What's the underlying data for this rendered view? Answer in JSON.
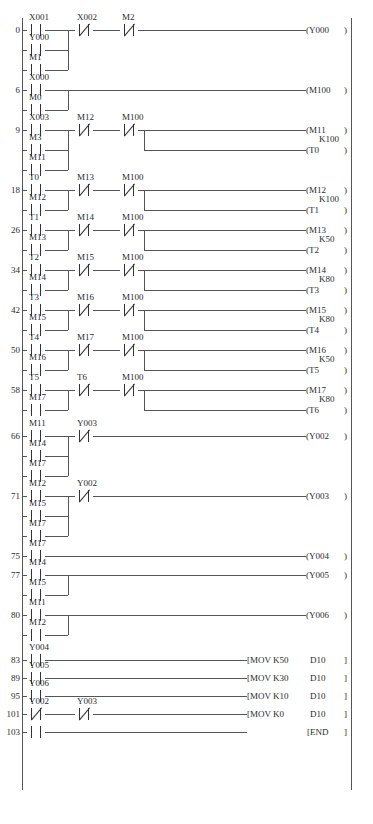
{
  "diagram": {
    "type": "plc-ladder-logic",
    "end_label": "END",
    "mov_label": "MOV",
    "rungs": [
      {
        "step": "0",
        "inputs_series": [
          {
            "name": "X001",
            "type": "NO"
          },
          {
            "name": "X002",
            "type": "NC"
          },
          {
            "name": "M2",
            "type": "NC"
          }
        ],
        "parallel_branch": [
          {
            "name": "Y000",
            "type": "NO"
          },
          {
            "name": "M1",
            "type": "NO"
          }
        ],
        "outputs": [
          {
            "name": "Y000",
            "type": "coil"
          }
        ]
      },
      {
        "step": "6",
        "inputs_series": [
          {
            "name": "X000",
            "type": "NO"
          }
        ],
        "parallel_branch": [
          {
            "name": "M0",
            "type": "NO"
          }
        ],
        "outputs": [
          {
            "name": "M100",
            "type": "coil"
          }
        ]
      },
      {
        "step": "9",
        "inputs_series": [
          {
            "name": "X003",
            "type": "NO"
          },
          {
            "name": "M12",
            "type": "NC"
          },
          {
            "name": "M100",
            "type": "NC"
          }
        ],
        "parallel_branch": [
          {
            "name": "M3",
            "type": "NO"
          },
          {
            "name": "M11",
            "type": "NO"
          }
        ],
        "outputs": [
          {
            "name": "M11",
            "type": "coil"
          },
          {
            "name": "T0",
            "type": "timer",
            "preset": "K100"
          }
        ]
      },
      {
        "step": "18",
        "inputs_series": [
          {
            "name": "T0",
            "type": "NO"
          },
          {
            "name": "M13",
            "type": "NC"
          },
          {
            "name": "M100",
            "type": "NC"
          }
        ],
        "parallel_branch": [
          {
            "name": "M12",
            "type": "NO"
          }
        ],
        "outputs": [
          {
            "name": "M12",
            "type": "coil"
          },
          {
            "name": "T1",
            "type": "timer",
            "preset": "K100"
          }
        ]
      },
      {
        "step": "26",
        "inputs_series": [
          {
            "name": "T1",
            "type": "NO"
          },
          {
            "name": "M14",
            "type": "NC"
          },
          {
            "name": "M100",
            "type": "NC"
          }
        ],
        "parallel_branch": [
          {
            "name": "M13",
            "type": "NO"
          }
        ],
        "outputs": [
          {
            "name": "M13",
            "type": "coil"
          },
          {
            "name": "T2",
            "type": "timer",
            "preset": "K50"
          }
        ]
      },
      {
        "step": "34",
        "inputs_series": [
          {
            "name": "T2",
            "type": "NO"
          },
          {
            "name": "M15",
            "type": "NC"
          },
          {
            "name": "M100",
            "type": "NC"
          }
        ],
        "parallel_branch": [
          {
            "name": "M14",
            "type": "NO"
          }
        ],
        "outputs": [
          {
            "name": "M14",
            "type": "coil"
          },
          {
            "name": "T3",
            "type": "timer",
            "preset": "K80"
          }
        ]
      },
      {
        "step": "42",
        "inputs_series": [
          {
            "name": "T3",
            "type": "NO"
          },
          {
            "name": "M16",
            "type": "NC"
          },
          {
            "name": "M100",
            "type": "NC"
          }
        ],
        "parallel_branch": [
          {
            "name": "M15",
            "type": "NO"
          }
        ],
        "outputs": [
          {
            "name": "M15",
            "type": "coil"
          },
          {
            "name": "T4",
            "type": "timer",
            "preset": "K80"
          }
        ]
      },
      {
        "step": "50",
        "inputs_series": [
          {
            "name": "T4",
            "type": "NO"
          },
          {
            "name": "M17",
            "type": "NC"
          },
          {
            "name": "M100",
            "type": "NC"
          }
        ],
        "parallel_branch": [
          {
            "name": "M16",
            "type": "NO"
          }
        ],
        "outputs": [
          {
            "name": "M16",
            "type": "coil"
          },
          {
            "name": "T5",
            "type": "timer",
            "preset": "K50"
          }
        ]
      },
      {
        "step": "58",
        "inputs_series": [
          {
            "name": "T5",
            "type": "NO"
          },
          {
            "name": "T6",
            "type": "NC"
          },
          {
            "name": "M100",
            "type": "NC"
          }
        ],
        "parallel_branch": [
          {
            "name": "M17",
            "type": "NO"
          }
        ],
        "outputs": [
          {
            "name": "M17",
            "type": "coil"
          },
          {
            "name": "T6",
            "type": "timer",
            "preset": "K80"
          }
        ]
      },
      {
        "step": "66",
        "inputs_series": [
          {
            "name": "M11",
            "type": "NO"
          },
          {
            "name": "Y003",
            "type": "NC"
          }
        ],
        "parallel_branch": [
          {
            "name": "M14",
            "type": "NO"
          },
          {
            "name": "M17",
            "type": "NO"
          }
        ],
        "outputs": [
          {
            "name": "Y002",
            "type": "coil"
          }
        ]
      },
      {
        "step": "71",
        "inputs_series": [
          {
            "name": "M12",
            "type": "NO"
          },
          {
            "name": "Y002",
            "type": "NC"
          }
        ],
        "parallel_branch": [
          {
            "name": "M15",
            "type": "NO"
          },
          {
            "name": "M17",
            "type": "NO"
          }
        ],
        "outputs": [
          {
            "name": "Y003",
            "type": "coil"
          }
        ]
      },
      {
        "step": "75",
        "inputs_series": [
          {
            "name": "M17",
            "type": "NO"
          }
        ],
        "parallel_branch": [],
        "outputs": [
          {
            "name": "Y004",
            "type": "coil"
          }
        ]
      },
      {
        "step": "77",
        "inputs_series": [
          {
            "name": "M14",
            "type": "NO"
          }
        ],
        "parallel_branch": [
          {
            "name": "M15",
            "type": "NO"
          }
        ],
        "outputs": [
          {
            "name": "Y005",
            "type": "coil"
          }
        ]
      },
      {
        "step": "80",
        "inputs_series": [
          {
            "name": "M11",
            "type": "NO"
          }
        ],
        "parallel_branch": [
          {
            "name": "M12",
            "type": "NO"
          }
        ],
        "outputs": [
          {
            "name": "Y006",
            "type": "coil"
          }
        ]
      },
      {
        "step": "83",
        "inputs_series": [
          {
            "name": "Y004",
            "type": "NO"
          }
        ],
        "parallel_branch": [],
        "outputs": [
          {
            "name": "MOV",
            "type": "func",
            "src": "K50",
            "dst": "D10"
          }
        ]
      },
      {
        "step": "89",
        "inputs_series": [
          {
            "name": "Y005",
            "type": "NO"
          }
        ],
        "parallel_branch": [],
        "outputs": [
          {
            "name": "MOV",
            "type": "func",
            "src": "K30",
            "dst": "D10"
          }
        ]
      },
      {
        "step": "95",
        "inputs_series": [
          {
            "name": "Y006",
            "type": "NO"
          }
        ],
        "parallel_branch": [],
        "outputs": [
          {
            "name": "MOV",
            "type": "func",
            "src": "K10",
            "dst": "D10"
          }
        ]
      },
      {
        "step": "101",
        "inputs_series": [
          {
            "name": "Y002",
            "type": "NC"
          },
          {
            "name": "Y003",
            "type": "NC"
          }
        ],
        "parallel_branch": [],
        "outputs": [
          {
            "name": "MOV",
            "type": "func",
            "src": "K0",
            "dst": "D10"
          }
        ]
      },
      {
        "step": "103",
        "inputs_series": [
          {
            "name": "",
            "type": "NO"
          }
        ],
        "parallel_branch": [],
        "outputs": [
          {
            "name": "END",
            "type": "end"
          }
        ]
      }
    ]
  },
  "style": {
    "line_color": "#555555",
    "text_color": "#2b2b2b",
    "background": "#ffffff"
  }
}
